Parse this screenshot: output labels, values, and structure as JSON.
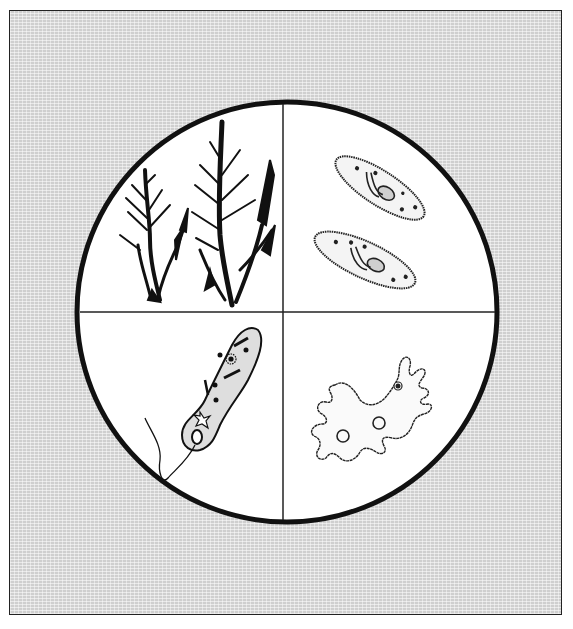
{
  "figure": {
    "background": {
      "pattern": "fine gray woven texture",
      "color": "#cfcfcf"
    },
    "circle": {
      "cx": 287,
      "cy": 312,
      "r": 210,
      "stroke": "#111111",
      "fill": "#ffffff"
    },
    "quadrants": [
      {
        "position": "top-left",
        "label": "Algae (branching seaweed plants)",
        "icon": "algae-icon"
      },
      {
        "position": "top-right",
        "label": "Paramecium (two ciliated cells)",
        "icon": "paramecium-icon"
      },
      {
        "position": "bottom-left",
        "label": "Euglena (flagellated cell)",
        "icon": "euglena-icon"
      },
      {
        "position": "bottom-right",
        "label": "Amoeba (irregular pseudopods)",
        "icon": "amoeba-icon"
      }
    ]
  }
}
